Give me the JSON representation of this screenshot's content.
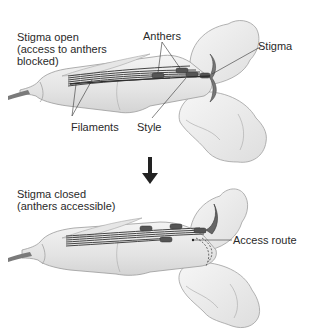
{
  "top_panel": {
    "caption_line1": "Stigma open",
    "caption_line2": "(access to anthers",
    "caption_line3": "blocked)",
    "labels": {
      "anthers": "Anthers",
      "stigma": "Stigma",
      "filaments": "Filaments",
      "style": "Style"
    }
  },
  "transition": {
    "arrow": "down-arrow"
  },
  "bottom_panel": {
    "caption_line1": "Stigma closed",
    "caption_line2": "(anthers accessible)",
    "labels": {
      "access_route": "Access route"
    }
  },
  "colors": {
    "petal_fill": "#ececec",
    "petal_stroke": "#9a9a9a",
    "stamen": "#4a4a4a",
    "anther": "#555555",
    "leader_line": "#333333",
    "arrow": "#222222"
  }
}
